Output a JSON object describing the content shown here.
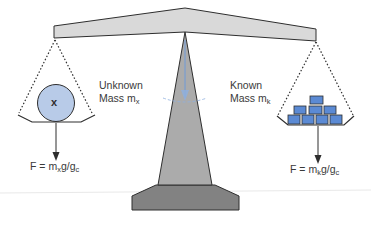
{
  "diagram": {
    "type": "balance-scale",
    "colors": {
      "beam_fill": "#d9d9d9",
      "fulcrum_fill": "#a9a9a9",
      "base_fill": "#808080",
      "outline": "#2e2e2e",
      "unknown_mass_fill": "#b8cbe8",
      "known_mass_fill": "#5b8ad4",
      "pointer": "#6f9ad8",
      "ground_line": "#e6e6e6"
    },
    "left": {
      "label_line1": "Unknown",
      "label_line2_prefix": "Mass m",
      "label_subscript": "x",
      "mass_symbol": "x",
      "formula_prefix": "F = m",
      "formula_sub1": "x",
      "formula_mid": "g/g",
      "formula_sub2": "c"
    },
    "right": {
      "label_line1": "Known",
      "label_line2_prefix": "Mass m",
      "label_subscript": "k",
      "formula_prefix": "F = m",
      "formula_sub1": "k",
      "formula_mid": "g/g",
      "formula_sub2": "c",
      "brick_rows": [
        1,
        3,
        4
      ]
    }
  }
}
